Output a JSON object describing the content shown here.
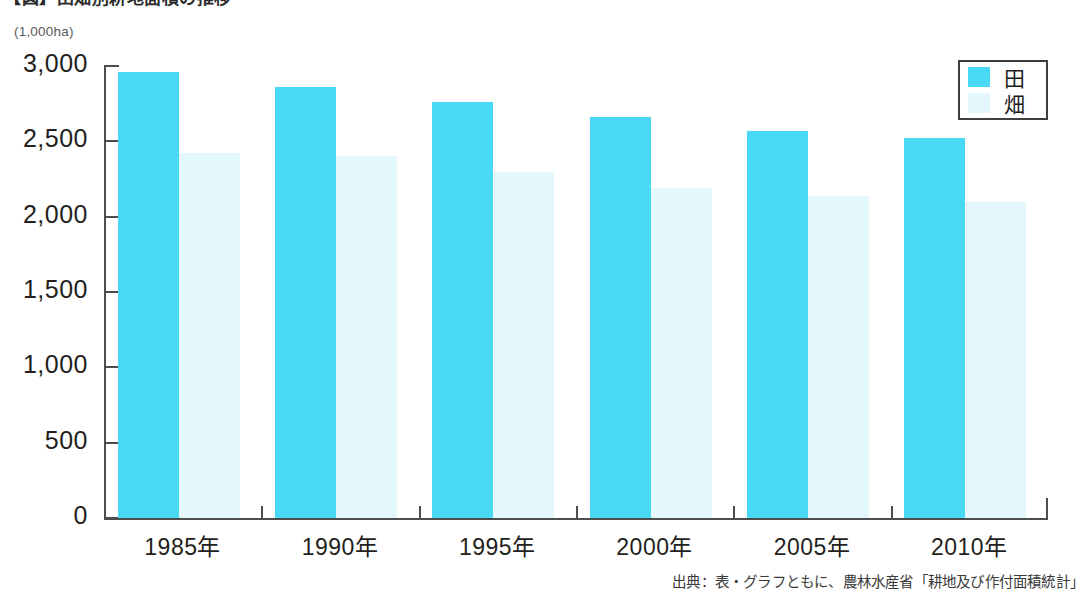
{
  "title": "【図】田畑別耕地面積の推移",
  "unit_label": "(1,000ha)",
  "legend": {
    "items": [
      {
        "label": "田",
        "color": "#4ad9f5"
      },
      {
        "label": "畑",
        "color": "#e4f8fc"
      }
    ]
  },
  "source_note": "出典：表・グラフともに、農林水産省「耕地及び作付面積統計」",
  "chart_data": {
    "type": "bar",
    "title": "【図】田畑別耕地面積の推移",
    "xlabel": "",
    "ylabel": "(1,000ha)",
    "ylim": [
      0,
      3000
    ],
    "yticks": [
      0,
      500,
      1000,
      1500,
      2000,
      2500,
      3000
    ],
    "ytick_labels": [
      "0",
      "500",
      "1,000",
      "1,500",
      "2,000",
      "2,500",
      "3,000"
    ],
    "categories": [
      "1985年",
      "1990年",
      "1995年",
      "2000年",
      "2005年",
      "2010年"
    ],
    "grid": false,
    "legend_position": "top-right",
    "series": [
      {
        "name": "田",
        "color": "#4ad9f5",
        "values": [
          2960,
          2860,
          2760,
          2660,
          2570,
          2520
        ]
      },
      {
        "name": "畑",
        "color": "#e4f8fc",
        "values": [
          2420,
          2400,
          2295,
          2190,
          2135,
          2100
        ]
      }
    ]
  }
}
